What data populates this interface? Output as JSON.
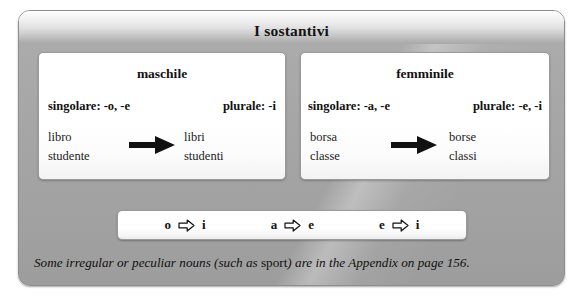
{
  "panel": {
    "title": "I sostantivi"
  },
  "boxes": [
    {
      "id": "maschile",
      "title": "maschile",
      "singular_rule": "singolare: -o, -e",
      "plural_rule": "plurale: -i",
      "arrow_icon": "solid-right-arrow-icon",
      "singular_examples": [
        "libro",
        "studente"
      ],
      "plural_examples": [
        "libri",
        "studenti"
      ]
    },
    {
      "id": "femminile",
      "title": "femminile",
      "singular_rule": "singolare: -a, -e",
      "plural_rule": "plurale: -e, -i",
      "arrow_icon": "solid-right-arrow-icon",
      "singular_examples": [
        "borsa",
        "classe"
      ],
      "plural_examples": [
        "borse",
        "classi"
      ]
    }
  ],
  "summary": {
    "arrow_icon": "hollow-right-arrow-icon",
    "pairs": [
      {
        "from": "o",
        "to": "i"
      },
      {
        "from": "a",
        "to": "e"
      },
      {
        "from": "e",
        "to": "i"
      }
    ]
  },
  "footnote": {
    "part1": "Some irregular or peculiar nouns (such as ",
    "emphasis": "sport",
    "part2": ") are in the Appendix on page 156."
  },
  "colors": {
    "panel_gray": "#a6a6a6",
    "box_white": "#ffffff",
    "text_black": "#111111",
    "border_gray": "#9a9a9a"
  }
}
